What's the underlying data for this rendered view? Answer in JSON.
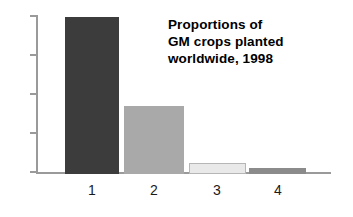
{
  "chart_data": {
    "type": "bar",
    "title": "Proportions of GM crops planted worldwide, 1998",
    "title_lines": [
      "Proportions of",
      "GM crops planted",
      "worldwide, 1998"
    ],
    "xlabel": "",
    "ylabel": "",
    "categories": [
      "1",
      "2",
      "3",
      "4"
    ],
    "values": [
      100,
      43,
      7,
      4
    ],
    "ylim": [
      0,
      100
    ],
    "grid": false,
    "legend": "none",
    "y_tick_count": 5,
    "y_tick_labels": [
      "",
      "",
      "",
      "",
      ""
    ],
    "bars": [
      {
        "category": "1",
        "value": 100,
        "color": "#3c3c3c"
      },
      {
        "category": "2",
        "value": 43,
        "color": "#a9a9a9"
      },
      {
        "category": "3",
        "value": 7,
        "color": "#e9e9e9"
      },
      {
        "category": "4",
        "value": 4,
        "color": "#8b8b8b"
      }
    ],
    "axis_color": "#9a9a9a",
    "background": "#ffffff"
  },
  "axis": {
    "ticks": [
      {
        "label": ""
      },
      {
        "label": ""
      },
      {
        "label": ""
      },
      {
        "label": ""
      },
      {
        "label": ""
      }
    ]
  },
  "x_labels": [
    "1",
    "2",
    "3",
    "4"
  ]
}
